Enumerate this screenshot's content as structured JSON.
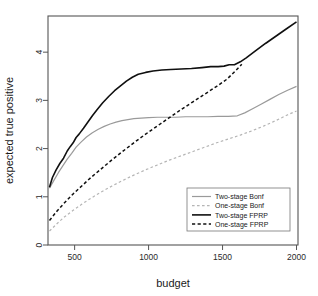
{
  "chart_data": {
    "type": "line",
    "title": "",
    "xlabel": "budget",
    "ylabel": "expected true positive",
    "xlim": [
      320,
      2010
    ],
    "ylim": [
      0,
      4.75
    ],
    "grid": false,
    "legend_position": "bottom-right",
    "xticks": [
      500,
      1000,
      1500,
      2000
    ],
    "xtick_labels": [
      "500",
      "1000",
      "1500",
      "2000"
    ],
    "yticks": [
      0,
      1,
      2,
      3,
      4
    ],
    "ytick_labels": [
      "0",
      "1",
      "2",
      "3",
      "4"
    ],
    "series": [
      {
        "name": "Two-stage Bonf",
        "color": "#9a9a9a",
        "dash": "solid",
        "width": 1.2,
        "x": [
          330,
          360,
          390,
          420,
          450,
          480,
          510,
          545,
          580,
          620,
          660,
          700,
          740,
          780,
          820,
          860,
          900,
          950,
          1000,
          1060,
          1120,
          1180,
          1250,
          1320,
          1400,
          1470,
          1540,
          1600,
          1650,
          1700,
          1760,
          1820,
          1880,
          1940,
          2000
        ],
        "y": [
          1.18,
          1.34,
          1.5,
          1.64,
          1.78,
          1.9,
          2.03,
          2.14,
          2.24,
          2.33,
          2.4,
          2.46,
          2.51,
          2.55,
          2.58,
          2.6,
          2.62,
          2.63,
          2.64,
          2.65,
          2.65,
          2.65,
          2.66,
          2.66,
          2.66,
          2.67,
          2.67,
          2.68,
          2.74,
          2.82,
          2.92,
          3.02,
          3.12,
          3.21,
          3.29
        ]
      },
      {
        "name": "One-stage Bonf",
        "color": "#b5b5b5",
        "dash": "dashed",
        "width": 1.2,
        "x": [
          330,
          380,
          430,
          490,
          550,
          610,
          680,
          750,
          820,
          900,
          980,
          1060,
          1140,
          1220,
          1300,
          1380,
          1460,
          1540,
          1620,
          1700,
          1780,
          1860,
          1940,
          2000
        ],
        "y": [
          0.29,
          0.44,
          0.58,
          0.72,
          0.85,
          0.97,
          1.1,
          1.22,
          1.33,
          1.45,
          1.56,
          1.66,
          1.76,
          1.85,
          1.94,
          2.03,
          2.12,
          2.2,
          2.28,
          2.37,
          2.47,
          2.58,
          2.7,
          2.78
        ]
      },
      {
        "name": "Two-stage FPRP",
        "color": "#101010",
        "dash": "solid",
        "width": 1.6,
        "x": [
          330,
          350,
          375,
          400,
          425,
          450,
          470,
          490,
          510,
          530,
          560,
          590,
          620,
          650,
          690,
          730,
          770,
          810,
          850,
          890,
          930,
          980,
          1030,
          1090,
          1150,
          1220,
          1290,
          1360,
          1420,
          1470,
          1510,
          1545,
          1580,
          1620,
          1660,
          1720,
          1790,
          1860,
          1930,
          2000
        ],
        "y": [
          1.2,
          1.4,
          1.56,
          1.69,
          1.8,
          1.95,
          2.04,
          2.12,
          2.23,
          2.3,
          2.42,
          2.55,
          2.68,
          2.8,
          2.95,
          3.08,
          3.2,
          3.3,
          3.4,
          3.48,
          3.54,
          3.58,
          3.61,
          3.63,
          3.64,
          3.65,
          3.66,
          3.68,
          3.7,
          3.7,
          3.71,
          3.74,
          3.74,
          3.8,
          3.88,
          4.02,
          4.18,
          4.33,
          4.48,
          4.63
        ]
      },
      {
        "name": "One-stage FPRP",
        "color": "#101010",
        "dash": "dashed",
        "width": 1.5,
        "x": [
          330,
          380,
          430,
          490,
          550,
          610,
          680,
          750,
          820,
          900,
          980,
          1060,
          1140,
          1220,
          1300,
          1380,
          1460,
          1530,
          1590,
          1630
        ],
        "y": [
          0.51,
          0.7,
          0.87,
          1.06,
          1.23,
          1.4,
          1.58,
          1.76,
          1.93,
          2.12,
          2.3,
          2.47,
          2.64,
          2.81,
          2.97,
          3.13,
          3.29,
          3.44,
          3.62,
          3.75
        ]
      }
    ]
  },
  "legend": {
    "items": [
      {
        "label": "Two-stage Bonf"
      },
      {
        "label": "One-stage Bonf"
      },
      {
        "label": "Two-stage FPRP"
      },
      {
        "label": "One-stage FPRP"
      }
    ]
  }
}
